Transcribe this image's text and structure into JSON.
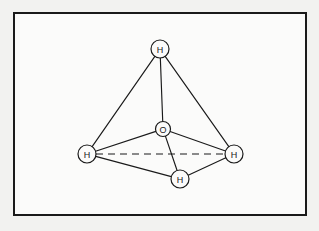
{
  "figure": {
    "kind": "molecular-structure-diagram",
    "title": "",
    "frame": {
      "x": 13,
      "y": 12,
      "width": 294,
      "height": 204,
      "border_color": "#1a1a1a",
      "border_width": 2,
      "fill_color": "#fbfbfa"
    },
    "page_background": "#f2f2f0",
    "line_color": "#1a1a1a"
  },
  "atoms": [
    {
      "id": "h-top",
      "label": "H",
      "cx": 145,
      "cy": 35,
      "r": 9.0,
      "name": "atom-h-top"
    },
    {
      "id": "o-center",
      "label": "O",
      "cx": 148,
      "cy": 115,
      "r": 7.5,
      "name": "atom-o-center"
    },
    {
      "id": "h-left",
      "label": "H",
      "cx": 72,
      "cy": 140,
      "r": 9.0,
      "name": "atom-h-left"
    },
    {
      "id": "h-right",
      "label": "H",
      "cx": 219,
      "cy": 140,
      "r": 9.0,
      "name": "atom-h-right"
    },
    {
      "id": "h-bottom",
      "label": "H",
      "cx": 165,
      "cy": 165,
      "r": 9.0,
      "name": "atom-h-bottom"
    }
  ],
  "bonds": [
    {
      "from": "h-top",
      "to": "h-left",
      "style": "solid",
      "name": "bond-h-top-h-left"
    },
    {
      "from": "h-top",
      "to": "h-right",
      "style": "solid",
      "name": "bond-h-top-h-right"
    },
    {
      "from": "h-top",
      "to": "o-center",
      "style": "solid",
      "name": "bond-h-top-o"
    },
    {
      "from": "o-center",
      "to": "h-left",
      "style": "solid",
      "name": "bond-o-h-left"
    },
    {
      "from": "o-center",
      "to": "h-right",
      "style": "solid",
      "name": "bond-o-h-right"
    },
    {
      "from": "o-center",
      "to": "h-bottom",
      "style": "solid",
      "name": "bond-o-h-bottom"
    },
    {
      "from": "h-left",
      "to": "h-bottom",
      "style": "solid",
      "name": "bond-h-left-h-bottom"
    },
    {
      "from": "h-right",
      "to": "h-bottom",
      "style": "solid",
      "name": "bond-h-right-h-bottom"
    },
    {
      "from": "h-left",
      "to": "h-right",
      "style": "dashed",
      "name": "bond-h-left-h-right-hidden"
    }
  ]
}
